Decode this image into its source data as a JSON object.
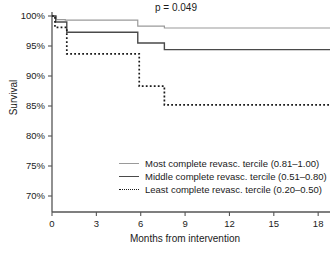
{
  "chart_data": {
    "type": "line",
    "subtype": "kaplan-meier-step",
    "title": "",
    "xlabel": "Months from intervention",
    "ylabel": "Survival",
    "xlim": [
      0,
      18.8
    ],
    "ylim": [
      70,
      100
    ],
    "grid": false,
    "x_ticks": [
      0,
      3,
      6,
      9,
      12,
      15,
      18
    ],
    "x_tick_labels": [
      "0",
      "3",
      "6",
      "9",
      "12",
      "15",
      "18"
    ],
    "y_ticks": [
      70,
      75,
      80,
      85,
      90,
      95,
      100
    ],
    "y_tick_labels": [
      "70%",
      "75%",
      "80%",
      "85%",
      "90%",
      "95%",
      "100%"
    ],
    "annotations": [
      {
        "name": "p-value",
        "text": "p = 0.049",
        "x": 10.5,
        "y": 100.8
      }
    ],
    "legend_position": "center-bottom-right",
    "series": [
      {
        "name": "Most complete revasc. tercile (0.81–1.00)",
        "style": "solid",
        "color": "#9a9a9a",
        "x": [
          0,
          0.3,
          0.3,
          0.9,
          0.9,
          5.8,
          5.8,
          7.6,
          7.6,
          18.8
        ],
        "y": [
          100,
          100,
          99.4,
          99.4,
          99.3,
          99.3,
          98.3,
          98.3,
          98.0,
          98.0
        ]
      },
      {
        "name": "Middle complete revasc. tercile (0.51–0.80)",
        "style": "solid",
        "color": "#4a4a4a",
        "x": [
          0,
          0.25,
          0.25,
          1.0,
          1.0,
          5.8,
          5.8,
          7.6,
          7.6,
          18.8
        ],
        "y": [
          100,
          100,
          99.0,
          99.0,
          97.3,
          97.3,
          95.5,
          95.5,
          94.4,
          94.4
        ]
      },
      {
        "name": "Least complete revasc. tercile (0.20–0.50)",
        "style": "dotted",
        "color": "#1a1a1a",
        "x": [
          0,
          0.2,
          0.2,
          1.0,
          1.0,
          5.9,
          5.9,
          7.6,
          7.6,
          18.8
        ],
        "y": [
          100,
          100,
          98.1,
          98.1,
          93.7,
          93.7,
          88.3,
          88.3,
          85.2,
          85.2
        ]
      }
    ]
  },
  "axes": {
    "y_title": "Survival",
    "x_title": "Months from intervention"
  },
  "annotation": {
    "p_value": "p = 0.049"
  },
  "legend": {
    "entries": [
      {
        "label": "Most complete revasc. tercile (0.81–1.00)",
        "style": "solid",
        "color": "#9a9a9a"
      },
      {
        "label": "Middle complete revasc. tercile (0.51–0.80)",
        "style": "solid",
        "color": "#4a4a4a"
      },
      {
        "label": "Least complete revasc. tercile (0.20–0.50)",
        "style": "dotted",
        "color": "#1a1a1a"
      }
    ]
  },
  "colors": {
    "most_complete": "#9a9a9a",
    "middle_complete": "#4a4a4a",
    "least_complete": "#1a1a1a",
    "axis": "#4a4a4a",
    "background": "#ffffff"
  }
}
